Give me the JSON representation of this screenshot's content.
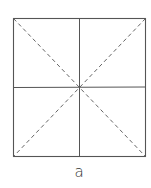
{
  "diagram": {
    "caption": "a",
    "square": {
      "x1": 13,
      "y1": 18,
      "x2": 145,
      "y2": 156
    },
    "center": {
      "x": 79,
      "y": 87
    },
    "solid_lines": [
      "vertical-center",
      "horizontal-center",
      "border"
    ],
    "dashed_lines": [
      "diagonal-tl-br",
      "diagonal-tr-bl"
    ],
    "colors": {
      "line": "#555555",
      "background": "#ffffff"
    }
  }
}
